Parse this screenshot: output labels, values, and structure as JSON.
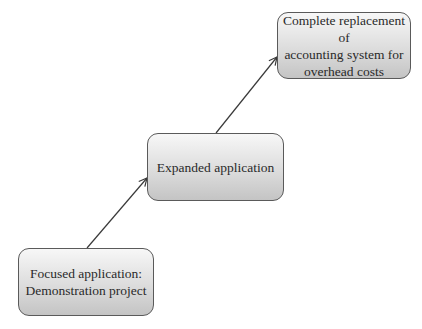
{
  "diagram": {
    "type": "staircase-progression",
    "nodes": [
      {
        "id": "focused",
        "label": "Focused application:\nDemonstration project"
      },
      {
        "id": "expanded",
        "label": "Expanded application"
      },
      {
        "id": "complete",
        "label": "Complete replacement of\naccounting system for\noverhead costs"
      }
    ],
    "edges": [
      {
        "from": "focused",
        "to": "expanded"
      },
      {
        "from": "expanded",
        "to": "complete"
      }
    ],
    "colors": {
      "box_border": "#5a5a5a",
      "box_fill_top": "#f7f7f7",
      "box_fill_bottom": "#c4c4c4",
      "arrow": "#3a3a3a",
      "text": "#2a2a2a"
    }
  }
}
